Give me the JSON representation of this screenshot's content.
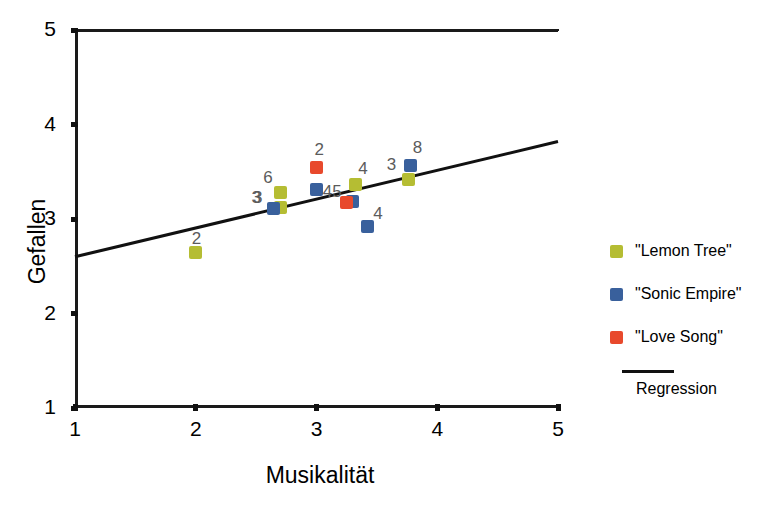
{
  "chart_data": {
    "type": "scatter",
    "title": "",
    "xlabel": "Musikalität",
    "ylabel": "Gefallen",
    "xlim": [
      1,
      5
    ],
    "ylim": [
      1,
      5
    ],
    "xticks": [
      "1",
      "2",
      "3",
      "4",
      "5"
    ],
    "yticks": [
      "1",
      "2",
      "3",
      "4",
      "5"
    ],
    "grid": false,
    "legend_position": "right",
    "series": [
      {
        "name": "\"Lemon Tree\"",
        "color": "#b5bd33",
        "points": [
          {
            "x": 2.0,
            "y": 2.65,
            "label": "2",
            "label_dx": -4,
            "label_dy": -22
          },
          {
            "x": 2.7,
            "y": 3.28,
            "label": "6",
            "label_dx": -17,
            "label_dy": -24
          },
          {
            "x": 2.7,
            "y": 3.12,
            "label": "",
            "label_dx": 0,
            "label_dy": 0
          },
          {
            "x": 3.32,
            "y": 3.37,
            "label": "4",
            "label_dx": 3,
            "label_dy": -24
          },
          {
            "x": 3.76,
            "y": 3.42,
            "label": "",
            "label_dx": 0,
            "label_dy": 0
          }
        ]
      },
      {
        "name": "\"Sonic Empire\"",
        "color": "#39609c",
        "points": [
          {
            "x": 2.64,
            "y": 3.11,
            "label": "3",
            "label_dx": -20,
            "label_dy": -20
          },
          {
            "x": 3.0,
            "y": 3.31,
            "label": "",
            "label_dx": 0,
            "label_dy": 0
          },
          {
            "x": 3.3,
            "y": 3.19,
            "label": "",
            "label_dx": 0,
            "label_dy": 0
          },
          {
            "x": 3.42,
            "y": 2.92,
            "label": "4",
            "label_dx": 6,
            "label_dy": -22
          },
          {
            "x": 3.78,
            "y": 3.57,
            "label": "8",
            "label_dx": 2,
            "label_dy": -26
          }
        ]
      },
      {
        "name": "\"Love Song\"",
        "color": "#e8492c",
        "points": [
          {
            "x": 3.0,
            "y": 3.55,
            "label": "2",
            "label_dx": -2,
            "label_dy": -26
          },
          {
            "x": 3.25,
            "y": 3.17,
            "label": "45",
            "label_dx": -24,
            "label_dy": -20
          }
        ]
      }
    ],
    "extra_labels": [
      {
        "text": "3",
        "x": 3.74,
        "y": 3.57,
        "dx": -19,
        "dy": -9
      },
      {
        "text": "3",
        "x": 2.66,
        "y": 3.24,
        "dx": -24,
        "dy": -7
      }
    ],
    "regression": {
      "label": "Regression",
      "color": "#111111",
      "x0": 1.0,
      "y0": 2.6,
      "x1": 5.0,
      "y1": 3.82
    }
  },
  "legend": {
    "items": [
      {
        "label": "\"Lemon Tree\"",
        "color": "#b5bd33"
      },
      {
        "label": "\"Sonic Empire\"",
        "color": "#39609c"
      },
      {
        "label": "\"Love Song\"",
        "color": "#e8492c"
      }
    ],
    "regression_label": "Regression"
  }
}
